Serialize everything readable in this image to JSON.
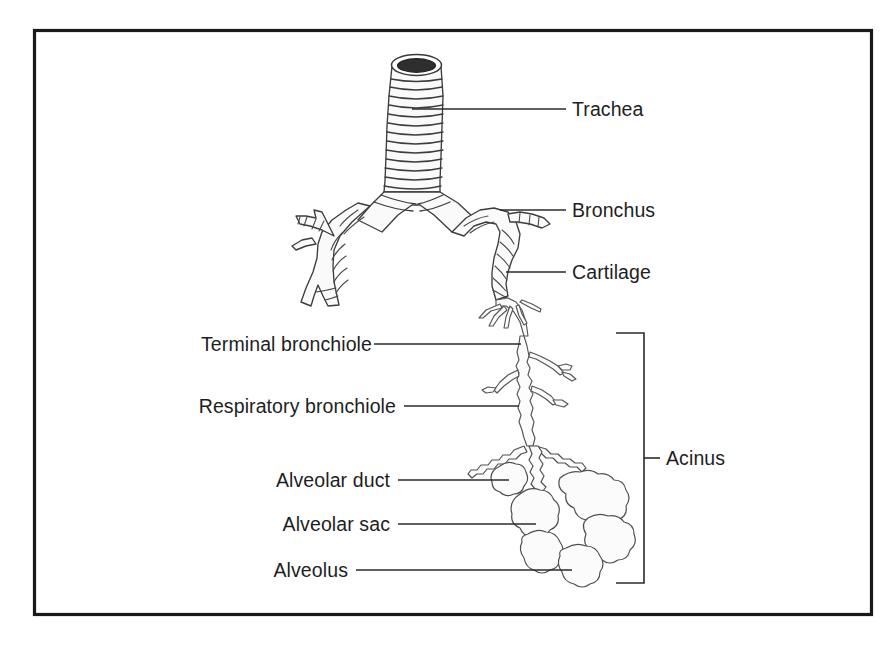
{
  "figure": {
    "background_color": "#ffffff",
    "frame_color": "#1a1a1a",
    "line_color": "#2b2b2b",
    "structure_fill": "#fafafa",
    "structure_stroke": "#3d3d3d"
  },
  "labels": {
    "trachea": "Trachea",
    "bronchus": "Bronchus",
    "cartilage": "Cartilage",
    "terminal_bronchiole": "Terminal bronchiole",
    "respiratory_bronchiole": "Respiratory bronchiole",
    "alveolar_duct": "Alveolar duct",
    "alveolar_sac": "Alveolar sac",
    "alveolus": "Alveolus",
    "acinus": "Acinus"
  }
}
